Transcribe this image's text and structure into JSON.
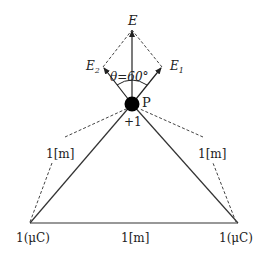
{
  "diagram": {
    "field_labels": {
      "resultant": "E",
      "e1": "E",
      "e1_sub": "1",
      "e2": "E",
      "e2_sub": "2",
      "angle": "θ=60°"
    },
    "point": {
      "name": "P",
      "charge": "+1"
    },
    "distances": {
      "left_side": "1[m]",
      "right_side": "1[m]",
      "base": "1[m]"
    },
    "charges": {
      "left": "1(μC)",
      "right": "1(μC)"
    }
  }
}
